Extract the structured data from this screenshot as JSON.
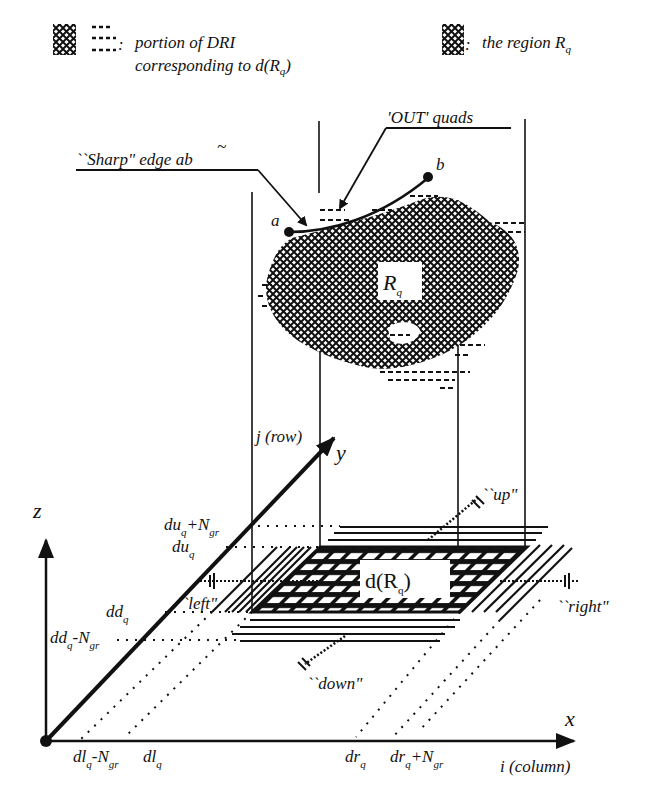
{
  "legend": {
    "left_symbols": [
      "crosshatch-swatch",
      "dashed-swatch"
    ],
    "left_text_line1": "portion of DRI",
    "left_text_line2_prefix": "corresponding to d(R",
    "left_text_line2_sub": "q",
    "left_text_line2_suffix": ")",
    "right_symbol": "crosshatch-swatch",
    "right_text_prefix": "the region R",
    "right_text_sub": "q",
    "colon": ":"
  },
  "callouts": {
    "sharp_edge": "``Sharp\" edge ab",
    "sharp_edge_tilde": "~",
    "out_quads": "'OUT' quads"
  },
  "points": {
    "a": "a",
    "b": "b"
  },
  "region": {
    "label": "R",
    "sub": "q"
  },
  "projection": {
    "label_prefix": "d(R",
    "label_sub": "q",
    "label_suffix": ")"
  },
  "directions": {
    "up": "``up\"",
    "down": "``down\"",
    "left": "``left\"",
    "right": "``right\""
  },
  "axes": {
    "z": "z",
    "y": "y",
    "x": "x",
    "y_caption": "j (row)",
    "x_caption": "i (column)"
  },
  "y_ticks": [
    {
      "main": "du",
      "sub": "q",
      "extra": "+N",
      "extra_sub": "gr"
    },
    {
      "main": "du",
      "sub": "q",
      "extra": "",
      "extra_sub": ""
    },
    {
      "main": "dd",
      "sub": "q",
      "extra": "",
      "extra_sub": ""
    },
    {
      "main": "dd",
      "sub": "q",
      "extra": "-N",
      "extra_sub": "gr"
    }
  ],
  "x_ticks": [
    {
      "main": "dl",
      "sub": "q",
      "extra": "-N",
      "extra_sub": "gr"
    },
    {
      "main": "dl",
      "sub": "q",
      "extra": "",
      "extra_sub": ""
    },
    {
      "main": "dr",
      "sub": "q",
      "extra": "",
      "extra_sub": ""
    },
    {
      "main": "dr",
      "sub": "q",
      "extra": "+N",
      "extra_sub": "gr"
    }
  ],
  "colors": {
    "ink": "#111111",
    "paper": "#ffffff"
  }
}
